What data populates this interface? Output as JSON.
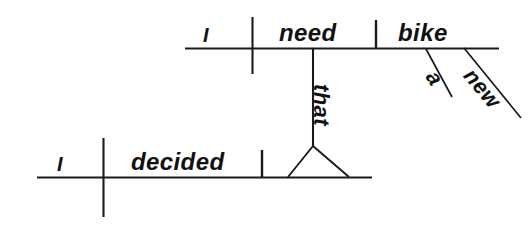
{
  "diagram": {
    "type": "reed-kellogg-sentence-diagram",
    "sentence": "I decided that I need a new bike.",
    "ink_color": "#1a1a1a",
    "background_color": "#ffffff",
    "clauses": [
      {
        "name": "main-clause",
        "baseline": {
          "x1": 37,
          "y1": 178,
          "x2": 372,
          "y2": 178
        },
        "words": [
          {
            "role": "subject",
            "text": "I"
          },
          {
            "role": "verb",
            "text": "decided"
          }
        ],
        "dividers": [
          {
            "role": "subject-verb-divider",
            "style": "crossing",
            "x": 103,
            "y1": 138,
            "y2": 217
          },
          {
            "role": "verb-object-divider",
            "style": "resting",
            "x": 262,
            "y1": 150,
            "y2": 178
          }
        ]
      },
      {
        "name": "subordinate-clause",
        "baseline": {
          "x1": 185,
          "y1": 48,
          "x2": 499,
          "y2": 48
        },
        "words": [
          {
            "role": "subject",
            "text": "I"
          },
          {
            "role": "verb",
            "text": "need"
          },
          {
            "role": "direct-object",
            "text": "bike"
          },
          {
            "role": "article-modifier",
            "text": "a"
          },
          {
            "role": "adjective-modifier",
            "text": "new"
          }
        ],
        "dividers": [
          {
            "role": "subject-verb-divider",
            "style": "crossing",
            "x": 252,
            "y1": 17,
            "y2": 74
          },
          {
            "role": "verb-object-divider",
            "style": "resting",
            "x": 376,
            "y1": 20,
            "y2": 48
          }
        ],
        "modifier_lines": [
          {
            "label": "a",
            "x1": 426,
            "y1": 49,
            "x2": 452,
            "y2": 97
          },
          {
            "label": "new",
            "x1": 464,
            "y1": 48,
            "x2": 521,
            "y2": 118
          }
        ]
      }
    ],
    "connector": {
      "role": "subordinating-conjunction-connector",
      "word": "that",
      "stem": {
        "x": 313,
        "y1": 49,
        "y2": 146
      },
      "tripod": {
        "apex_x": 313,
        "apex_y": 146,
        "left_x": 288,
        "right_x": 349,
        "base_y": 177
      }
    }
  }
}
